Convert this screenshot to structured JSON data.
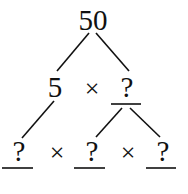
{
  "tree": {
    "root": "50",
    "level1": {
      "left": "5",
      "operator": "×",
      "right": "?"
    },
    "level2": {
      "a": "?",
      "op1": "×",
      "b": "?",
      "op2": "×",
      "c": "?"
    }
  }
}
